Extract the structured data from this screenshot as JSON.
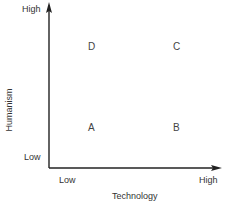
{
  "diagram": {
    "type": "2x2-matrix",
    "x_axis": {
      "title": "Technology",
      "low_label": "Low",
      "high_label": "High"
    },
    "y_axis": {
      "title": "Humanism",
      "low_label": "Low",
      "high_label": "High"
    },
    "quadrants": {
      "top_left": "D",
      "top_right": "C",
      "bottom_left": "A",
      "bottom_right": "B"
    },
    "colors": {
      "axis": "#222222",
      "text": "#333333"
    }
  }
}
